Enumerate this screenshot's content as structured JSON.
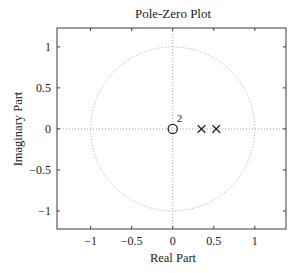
{
  "chart_data": {
    "type": "scatter",
    "title": "Pole-Zero Plot",
    "xlabel": "Real Part",
    "ylabel": "Imaginary Part",
    "xlim": [
      -1.41,
      1.38
    ],
    "ylim": [
      -1.22,
      1.23
    ],
    "xticks": [
      -1,
      -0.5,
      0,
      0.5,
      1
    ],
    "xtick_labels": [
      "−1",
      "−0.5",
      "0",
      "0.5",
      "1"
    ],
    "yticks": [
      1,
      0.5,
      0,
      -0.5,
      -1
    ],
    "ytick_labels": [
      "1",
      "0.5",
      "0",
      "−0.5",
      "−1"
    ],
    "grid": false,
    "unit_circle": {
      "center": [
        0,
        0
      ],
      "radius": 1,
      "style": "dotted",
      "color": "#9a9a9a"
    },
    "crosshair": {
      "style": "dotted",
      "color": "#9a9a9a"
    },
    "series": [
      {
        "name": "zeros",
        "marker": "circle",
        "points": [
          {
            "x": 0,
            "y": 0,
            "multiplicity": 2
          }
        ]
      },
      {
        "name": "poles",
        "marker": "x",
        "points": [
          {
            "x": 0.35,
            "y": 0
          },
          {
            "x": 0.53,
            "y": 0
          }
        ]
      }
    ],
    "annotations": [
      {
        "text": "2",
        "x": 0,
        "y": 0,
        "note": "double zero at origin"
      }
    ]
  },
  "labels": {
    "title": "Pole-Zero Plot",
    "xlabel": "Real Part",
    "ylabel": "Imaginary Part",
    "multiplicity": "2"
  },
  "colors": {
    "axes": "#3a3a3a",
    "guide": "#9a9a9a",
    "marker": "#1a1a1a",
    "text": "#1a1a1a",
    "background": "#ffffff"
  }
}
